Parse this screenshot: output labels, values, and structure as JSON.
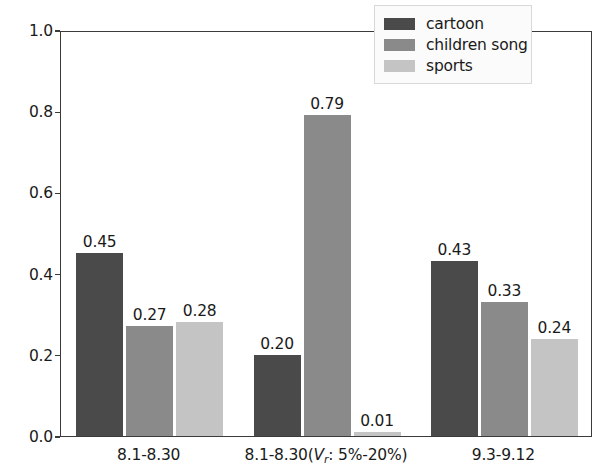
{
  "chart_data": {
    "type": "bar",
    "title": "",
    "xlabel": "",
    "ylabel": "",
    "ylim": [
      0.0,
      1.0
    ],
    "yticks": [
      "0.0",
      "0.2",
      "0.4",
      "0.6",
      "0.8",
      "1.0"
    ],
    "ytick_values": [
      0.0,
      0.2,
      0.4,
      0.6,
      0.8,
      1.0
    ],
    "grid": false,
    "legend_position": "upper right",
    "categories": [
      "8.1-8.30",
      "8.1-8.30(Vr: 5%-20%)",
      "9.3-9.12"
    ],
    "category_labels_html": [
      "8.1-8.30",
      "8.1-8.30(<i>V</i><sub>r</sub>: 5%-20%)",
      "9.3-9.12"
    ],
    "series": [
      {
        "name": "cartoon",
        "color": "#4a4a4a",
        "values": [
          0.45,
          0.2,
          0.43
        ],
        "labels": [
          "0.45",
          "0.20",
          "0.43"
        ]
      },
      {
        "name": "children song",
        "color": "#8a8a8a",
        "values": [
          0.27,
          0.79,
          0.33
        ],
        "labels": [
          "0.27",
          "0.79",
          "0.33"
        ]
      },
      {
        "name": "sports",
        "color": "#c4c4c4",
        "values": [
          0.28,
          0.01,
          0.24
        ],
        "labels": [
          "0.28",
          "0.01",
          "0.24"
        ]
      }
    ]
  },
  "legend": {
    "items": [
      {
        "label": "cartoon",
        "color": "#4a4a4a"
      },
      {
        "label": "children song",
        "color": "#8a8a8a"
      },
      {
        "label": "sports",
        "color": "#c4c4c4"
      }
    ]
  },
  "axis": {
    "spine_color": "#3a3a3a",
    "tick_color": "#3a3a3a",
    "text_color": "#1a1a1a",
    "background": "#ffffff"
  }
}
